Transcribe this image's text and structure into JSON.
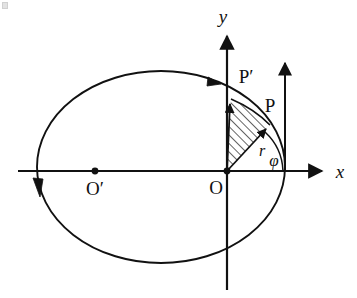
{
  "figure": {
    "kind": "orbital-geometry-diagram",
    "background_color": "#ffffff",
    "stroke_color": "#111111",
    "width": 357,
    "height": 298
  },
  "axes": {
    "x_label": "x",
    "y_label": "y",
    "x_axis": {
      "x1": 18,
      "y1": 171,
      "x2": 328,
      "y2": 171,
      "arrow": "right"
    },
    "y_axis": {
      "x1": 227,
      "y1": 290,
      "x2": 227,
      "y2": 33,
      "arrow": "up"
    },
    "x_label_pos": {
      "x": 340,
      "y": 177
    },
    "y_label_pos": {
      "x": 223,
      "y": 22
    }
  },
  "points": [
    {
      "name": "origin",
      "label": "O",
      "x": 227,
      "y": 171,
      "label_x": 215,
      "label_y": 190,
      "marker": "dot"
    },
    {
      "name": "ellipse-center",
      "label": "O′",
      "x": 95,
      "y": 171,
      "label_x": 87,
      "label_y": 191,
      "marker": "dot"
    },
    {
      "name": "point-p-prime",
      "label": "P′",
      "x": 231,
      "y": 99,
      "label_x": 238,
      "label_y": 77,
      "marker": "none"
    },
    {
      "name": "point-p",
      "label": "P",
      "x": 270,
      "y": 125,
      "label_x": 263,
      "label_y": 106,
      "marker": "none"
    }
  ],
  "orbit": {
    "name": "elliptical-orbit",
    "center_x": 161,
    "center_y": 167,
    "radius_x": 124,
    "radius_y": 96,
    "direction_label": "counterclockwise",
    "arrow_top_right": {
      "x": 218,
      "y": 82
    },
    "arrow_left": {
      "x": 38,
      "y": 191
    }
  },
  "vectors": [
    {
      "name": "radius-vector-r",
      "label": "r",
      "from_x": 227,
      "from_y": 171,
      "to_x": 270,
      "to_y": 125,
      "label_x": 263,
      "label_y": 152
    },
    {
      "name": "radius-vector-p-prime",
      "label": "",
      "from_x": 227,
      "from_y": 171,
      "to_x": 231,
      "to_y": 99,
      "label_x": 0,
      "label_y": 0
    }
  ],
  "angle": {
    "name": "polar-angle-phi",
    "label": "φ",
    "label_x": 275,
    "label_y": 163,
    "vertex_x": 227,
    "vertex_y": 171,
    "arc_radius": 56,
    "start_deg": 0,
    "end_deg": 47
  },
  "hatched_sector": {
    "name": "swept-area-sector",
    "fill_pattern": "diagonal-hatch",
    "hatch_angle_deg": 45,
    "description": "Area swept by the radius vector between P and P′"
  },
  "helper": {
    "name": "vertical-reference-arrow",
    "x": 285,
    "y_bottom": 171,
    "y_top": 60,
    "arrow": "up"
  }
}
